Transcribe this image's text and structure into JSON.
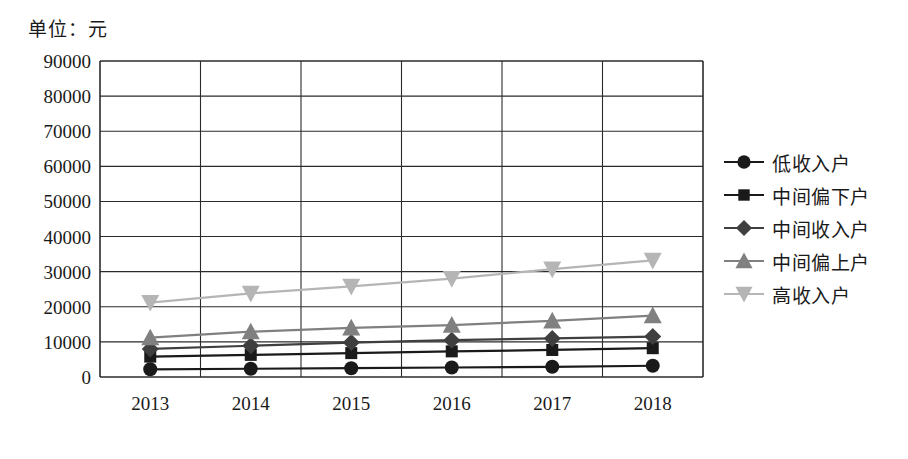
{
  "unit_title": "单位：元",
  "chart_data": {
    "type": "line",
    "title": "单位：元",
    "xlabel": "",
    "ylabel": "",
    "categories": [
      "2013",
      "2014",
      "2015",
      "2016",
      "2017",
      "2018"
    ],
    "ylim": [
      0,
      90000
    ],
    "ytick_labels": [
      "90000",
      "80000",
      "70000",
      "60000",
      "50000",
      "40000",
      "30000",
      "20000",
      "10000",
      "0"
    ],
    "ytick_values": [
      90000,
      80000,
      70000,
      60000,
      50000,
      40000,
      30000,
      20000,
      10000,
      0
    ],
    "grid": "horizontal-and-vertical",
    "legend_position": "right",
    "series": [
      {
        "name": "低收入户",
        "marker": "circle",
        "color": "#1a1a1a",
        "values": [
          2200,
          2350,
          2500,
          2700,
          2900,
          3200
        ]
      },
      {
        "name": "中间偏下户",
        "marker": "square",
        "color": "#1a1a1a",
        "values": [
          5800,
          6300,
          6800,
          7300,
          7700,
          8200
        ]
      },
      {
        "name": "中间收入户",
        "marker": "diamond",
        "color": "#3f3f3f",
        "values": [
          8000,
          8900,
          9800,
          10500,
          11000,
          11500
        ]
      },
      {
        "name": "中间偏上户",
        "marker": "triangle-up",
        "color": "#808080",
        "values": [
          11200,
          12900,
          14000,
          14800,
          16000,
          17500
        ]
      },
      {
        "name": "高收入户",
        "marker": "triangle-down",
        "color": "#b5b5b5",
        "values": [
          21200,
          23800,
          25800,
          28000,
          30700,
          33200
        ]
      }
    ]
  }
}
